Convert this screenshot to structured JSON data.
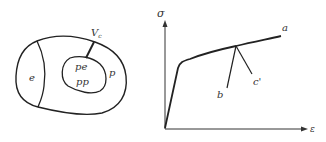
{
  "left_figure": {
    "regions": {
      "elastic": "e",
      "plastic": "p",
      "inner_elastic": "pe",
      "inner_plastic": "pp"
    },
    "volume_label_main": "V",
    "volume_label_sub": "c"
  },
  "right_figure": {
    "y_axis_label": "σ",
    "x_axis_label": "ε",
    "curve_label_a": "a",
    "branch_label_b": "b",
    "branch_label_c": "c'"
  },
  "colors": {
    "stroke": "#222222",
    "text": "#333333",
    "background": "#ffffff"
  }
}
